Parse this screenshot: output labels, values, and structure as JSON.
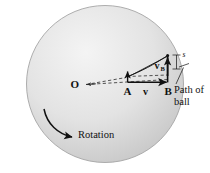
{
  "figure": {
    "kind": "physics-diagram",
    "background_color": "#ffffff",
    "disk": {
      "name": "rotating-disk",
      "center_x": 105,
      "center_y": 84,
      "radius": 79,
      "fill_light": "#f2f2f2",
      "fill_dark": "#c9c9c9",
      "stroke": "#9a9a9a"
    },
    "labels": {
      "center_point": "O",
      "point_a": "A",
      "point_b": "B",
      "velocity": "v",
      "velocity_b": "v",
      "velocity_b_subscript": "B",
      "deflection": "s",
      "rotation": "Rotation",
      "path_line1": "Path of",
      "path_line2": "ball"
    },
    "colors": {
      "ink": "#111111",
      "dashed": "#2b2b2b"
    }
  }
}
